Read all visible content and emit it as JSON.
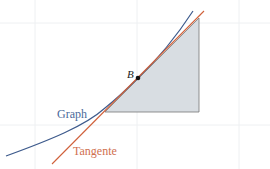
{
  "diagram": {
    "labels": {
      "point": "B",
      "graph": "Graph",
      "tangent": "Tangente"
    },
    "colors": {
      "graph": "#3d5a8c",
      "tangent": "#d0603a",
      "triangle_fill": "#d8dde2",
      "triangle_stroke": "#777777",
      "grid": "#eef0f2",
      "point": "#111111",
      "graph_label": "#4a6a9a",
      "tangent_label": "#d07050"
    },
    "grid": {
      "vertical_x": [
        35,
        137,
        239
      ],
      "horizontal_y": [
        23,
        125
      ]
    },
    "point_B": {
      "x": 138,
      "y": 78
    },
    "triangle": [
      [
        105,
        112
      ],
      [
        199,
        112
      ],
      [
        199,
        18
      ]
    ]
  }
}
